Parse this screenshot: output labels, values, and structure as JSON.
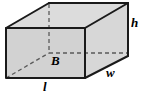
{
  "figure": {
    "name": "rectangular-prism",
    "labels": {
      "height": "h",
      "width": "w",
      "length": "l",
      "base_area": "B"
    },
    "colors": {
      "front_face_fill": "#d2d2d2",
      "top_face_fill": "#dcdcdc",
      "side_face_fill": "#d7d7d7",
      "edge_stroke": "#1a1a1a",
      "hidden_edge_stroke": "#5a5a5a",
      "background": "#ffffff",
      "label_color": "#000000"
    },
    "geometry": {
      "front_face": [
        [
          6,
          28
        ],
        [
          85,
          28
        ],
        [
          85,
          78
        ],
        [
          6,
          78
        ]
      ],
      "top_face": [
        [
          6,
          28
        ],
        [
          49,
          3
        ],
        [
          128,
          3
        ],
        [
          85,
          28
        ]
      ],
      "right_face": [
        [
          85,
          28
        ],
        [
          128,
          3
        ],
        [
          128,
          56
        ],
        [
          85,
          78
        ]
      ],
      "hidden_vertex": [
        49,
        53
      ],
      "hidden_edges": [
        [
          [
            49,
            3
          ],
          [
            49,
            53
          ]
        ],
        [
          [
            6,
            53
          ],
          [
            49,
            53
          ]
        ],
        [
          [
            49,
            53
          ],
          [
            128,
            53
          ]
        ],
        [
          [
            6,
            78
          ],
          [
            49,
            53
          ]
        ]
      ]
    }
  }
}
